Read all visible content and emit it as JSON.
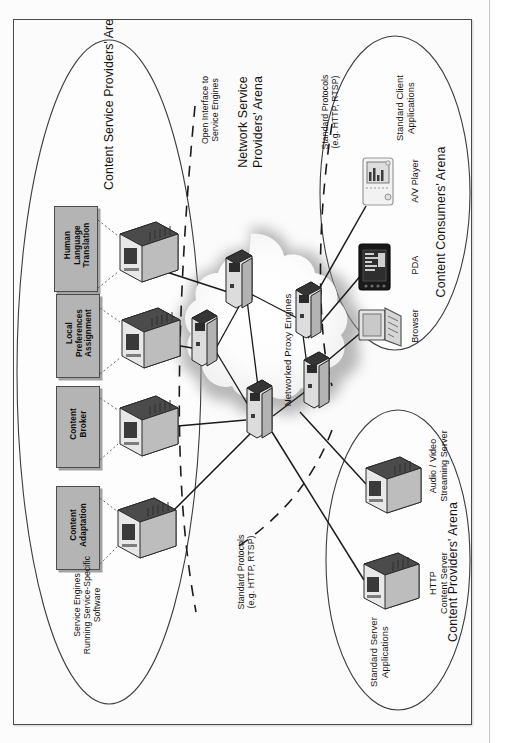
{
  "figure": {
    "type": "network-architecture-diagram",
    "orientation": "rotated-90-ccw",
    "arenas": [
      {
        "id": "content-service-providers",
        "title": "Content Service Providers' Arena",
        "caption": "Service Engines\nRunning Service-Specific\nSoftware"
      },
      {
        "id": "network-service-providers",
        "title": "Network Service\nProviders' Arena",
        "caption": "Networked Proxy Engines"
      },
      {
        "id": "content-consumers",
        "title": "Content Consumers' Arena",
        "caption": "Standard Client\nApplications"
      },
      {
        "id": "content-providers",
        "title": "Content Providers' Arena",
        "caption": "Standard Server\nApplications"
      }
    ],
    "service_engines": [
      {
        "label": "Human\nLanguage\nTranslation"
      },
      {
        "label": "Local\nPreferences\nAssignment"
      },
      {
        "label": "Content\nBroker"
      },
      {
        "label": "Content\nAdaptation"
      }
    ],
    "consumer_devices": [
      {
        "label": "A/V Player",
        "icon": "tablet-player-icon"
      },
      {
        "label": "PDA",
        "icon": "pda-icon"
      },
      {
        "label": "Browser",
        "icon": "desktop-pc-icon"
      }
    ],
    "provider_servers": [
      {
        "label": "Audio / Video\nStreaming Server",
        "icon": "server-icon"
      },
      {
        "label": "HTTP\nContent Server",
        "icon": "server-icon"
      }
    ],
    "interface_labels": [
      {
        "id": "open-interface",
        "text": "Open Interface to\nService Engines"
      },
      {
        "id": "protocols-consumers",
        "text": "Standard Protocols\n(e.g. HTTP, RTSP)"
      },
      {
        "id": "protocols-providers",
        "text": "Standard Protocols\n(e.g. HTTP, RTSP)"
      }
    ],
    "proxy_engine_count": 5,
    "colors": {
      "paper": "#fbfbfb",
      "frame_border": "#4a4a4a",
      "ellipse_stroke": "#3d3d3d",
      "service_box_fill": "#b4b4b4",
      "service_box_border": "#4d4d4d",
      "link_line": "#1a1a1a",
      "dashed_line": "#1a1a1a",
      "cloud_glow": "#9a9a9a",
      "text": "#121212"
    }
  }
}
